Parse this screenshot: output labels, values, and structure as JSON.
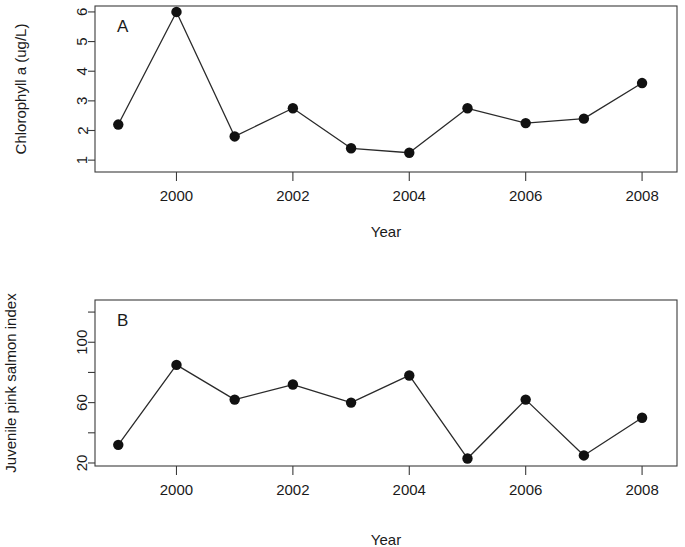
{
  "figure": {
    "background_color": "#ffffff",
    "line_color": "#2a2a2a",
    "point_color": "#111111",
    "axis_color": "#3b3b3b"
  },
  "panels": {
    "a": {
      "tag": "A",
      "ylabel": "Chlorophyll a (ug/L)",
      "xlabel": "Year",
      "ytick_labels": [
        "1",
        "2",
        "3",
        "4",
        "5",
        "6"
      ],
      "xtick_labels": [
        "2000",
        "2002",
        "2004",
        "2006",
        "2008"
      ]
    },
    "b": {
      "tag": "B",
      "ylabel": "Juvenile pink salmon index",
      "xlabel": "Year",
      "ytick_labels": [
        "20",
        "60",
        "100"
      ],
      "xtick_labels": [
        "2000",
        "2002",
        "2004",
        "2006",
        "2008"
      ]
    }
  },
  "chart_data": [
    {
      "type": "line",
      "panel": "A",
      "title": "A",
      "xlabel": "Year",
      "ylabel": "Chlorophyll a (ug/L)",
      "x": [
        1999,
        2000,
        2001,
        2002,
        2003,
        2004,
        2005,
        2006,
        2007,
        2008
      ],
      "values": [
        2.2,
        6.0,
        1.8,
        2.75,
        1.4,
        1.25,
        2.75,
        2.25,
        2.4,
        3.6
      ],
      "xlim": [
        1998.6,
        2008.6
      ],
      "ylim": [
        0.6,
        6.2
      ],
      "yticks": [
        1,
        2,
        3,
        4,
        5,
        6
      ],
      "xticks": [
        2000,
        2002,
        2004,
        2006,
        2008
      ],
      "grid": false,
      "legend": false,
      "markers": "filled-circle"
    },
    {
      "type": "line",
      "panel": "B",
      "title": "B",
      "xlabel": "Year",
      "ylabel": "Juvenile pink salmon index",
      "x": [
        1999,
        2000,
        2001,
        2002,
        2003,
        2004,
        2005,
        2006,
        2007,
        2008
      ],
      "values": [
        32,
        85,
        62,
        72,
        60,
        78,
        23,
        62,
        25,
        50
      ],
      "xlim": [
        1998.6,
        2008.6
      ],
      "ylim": [
        18,
        128
      ],
      "yticks": [
        20,
        40,
        60,
        80,
        100,
        120
      ],
      "ytick_labeled": [
        20,
        60,
        100
      ],
      "xticks": [
        2000,
        2002,
        2004,
        2006,
        2008
      ],
      "grid": false,
      "legend": false,
      "markers": "filled-circle"
    }
  ]
}
